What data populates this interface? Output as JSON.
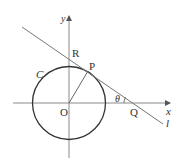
{
  "diagram": {
    "type": "geometry",
    "labels": {
      "y_axis": "y",
      "x_axis": "x",
      "origin": "O",
      "circle": "C",
      "tangent_point": "P",
      "y_intercept": "R",
      "x_intercept": "Q",
      "angle": "θ",
      "line": "l"
    },
    "colors": {
      "axis": "#888888",
      "circle": "#333333",
      "line": "#777777",
      "text": "#333333"
    }
  }
}
